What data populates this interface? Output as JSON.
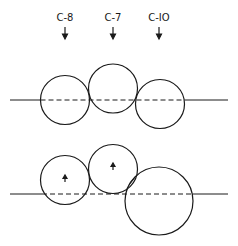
{
  "labels": [
    {
      "text": "C-8",
      "x": 65
    },
    {
      "text": "C-7",
      "x": 113
    },
    {
      "text": "C-IO",
      "x": 159
    }
  ],
  "colors": {
    "ink": "#1a1a1a",
    "background": "#ffffff"
  },
  "top_row": {
    "line_y": 100,
    "circles": [
      {
        "name": "C-8",
        "cx": 65,
        "cy": 100,
        "r": 24.5
      },
      {
        "name": "C-7",
        "cx": 113,
        "cy": 88.5,
        "r": 24.5
      },
      {
        "name": "C-10",
        "cx": 160,
        "cy": 104,
        "r": 24.5
      }
    ]
  },
  "bottom_row": {
    "line_y": 194,
    "circles": [
      {
        "name": "C-8",
        "cx": 65,
        "cy": 180,
        "r": 24.5,
        "arrow": true
      },
      {
        "name": "C-7",
        "cx": 113,
        "cy": 169,
        "r": 24.5,
        "arrow": true
      },
      {
        "name": "C-10",
        "cx": 159,
        "cy": 201,
        "r": 34,
        "arrow": false
      }
    ]
  }
}
